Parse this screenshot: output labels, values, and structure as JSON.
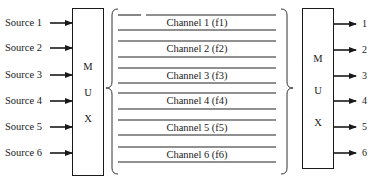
{
  "diagram": {
    "type": "frequency-division multiplexing",
    "sources": [
      {
        "label": "Source 1",
        "y": 23
      },
      {
        "label": "Source 2",
        "y": 48
      },
      {
        "label": "Source 3",
        "y": 75
      },
      {
        "label": "Source 4",
        "y": 101
      },
      {
        "label": "Source 5",
        "y": 127
      },
      {
        "label": "Source 6",
        "y": 153
      }
    ],
    "mux_left": {
      "letters": [
        "M",
        "U",
        "X"
      ]
    },
    "mux_right": {
      "letters": [
        "M",
        "U",
        "X"
      ]
    },
    "channels": [
      {
        "label": "Channel 1 (f1)",
        "top": 15,
        "bottom": 30
      },
      {
        "label": "Channel 2 (f2)",
        "top": 41,
        "bottom": 57
      },
      {
        "label": "Channel 3 (f3)",
        "top": 68,
        "bottom": 83
      },
      {
        "label": "Channel 4 (f4)",
        "top": 93,
        "bottom": 109
      },
      {
        "label": "Channel 5 (f5)",
        "top": 120,
        "bottom": 135
      },
      {
        "label": "Channel 6 (f6)",
        "top": 147,
        "bottom": 162
      }
    ],
    "outputs": [
      {
        "label": "1",
        "y": 24
      },
      {
        "label": "2",
        "y": 50
      },
      {
        "label": "3",
        "y": 76
      },
      {
        "label": "4",
        "y": 101
      },
      {
        "label": "5",
        "y": 127
      },
      {
        "label": "6",
        "y": 153
      }
    ],
    "colors": {
      "ink": "#1a1a1a",
      "background": "#ffffff"
    }
  }
}
